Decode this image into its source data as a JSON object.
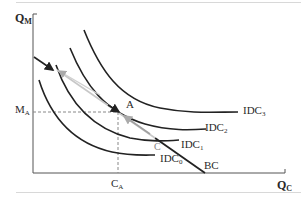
{
  "figure": {
    "y_axis_label": "Q",
    "y_axis_sub": "M",
    "x_axis_label": "Q",
    "x_axis_sub": "C",
    "m_a_label": "M",
    "m_a_sub": "A",
    "c_a_label": "C",
    "c_a_sub": "A",
    "point_a": "A",
    "point_c": "C",
    "budget_label": "BC",
    "curves": [
      {
        "id": "IDC3",
        "label": "IDC",
        "sub": "3"
      },
      {
        "id": "IDC2",
        "label": "IDC",
        "sub": "2"
      },
      {
        "id": "IDC1",
        "label": "IDC",
        "sub": "1"
      },
      {
        "id": "IDC0",
        "label": "IDC",
        "sub": "0"
      }
    ]
  },
  "colors": {
    "curve": "#222222",
    "arrow_gray": "#b5b5b5",
    "axis": "#555555",
    "dashed": "#888888"
  }
}
